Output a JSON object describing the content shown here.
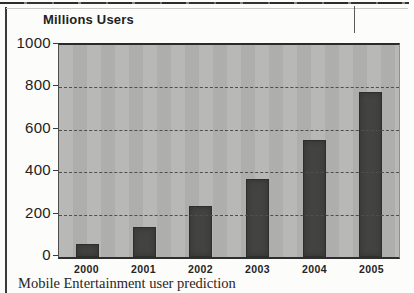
{
  "figure": {
    "title": "Millions Users",
    "caption": "Mobile Entertainment user prediction"
  },
  "chart_data": {
    "type": "bar",
    "title": "Millions Users",
    "categories": [
      "2000",
      "2001",
      "2002",
      "2003",
      "2004",
      "2005"
    ],
    "values": [
      60,
      140,
      240,
      370,
      550,
      780
    ],
    "xlabel": "",
    "ylabel": "Millions Users",
    "ylim": [
      0,
      1000
    ],
    "yticks": [
      1000,
      800,
      600,
      400,
      200,
      0
    ],
    "grid": "horizontal-dashed",
    "legend": "none",
    "colors": {
      "bar": "#434341",
      "plot_background": "#b3b3b1",
      "axis": "#2a2a2a"
    }
  }
}
